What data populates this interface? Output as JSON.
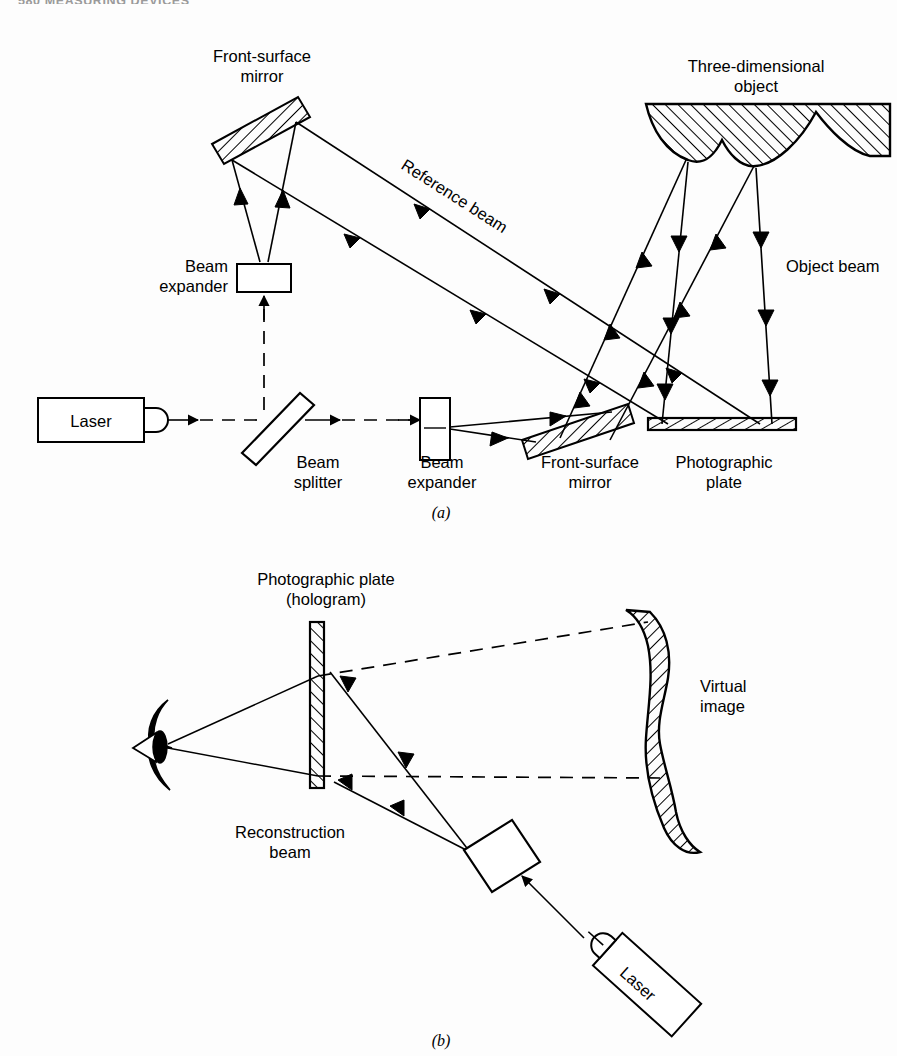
{
  "page": {
    "running_head": "580  MEASURING DEVICES",
    "width": 897,
    "height": 1056,
    "background": "#ffffff",
    "ink": "#000000"
  },
  "figure_a": {
    "caption": "(a)",
    "labels": {
      "front_surface_mirror_top_line1": "Front-surface",
      "front_surface_mirror_top_line2": "mirror",
      "beam_expander_left_line1": "Beam",
      "beam_expander_left_line2": "expander",
      "reference_beam": "Reference beam",
      "three_dimensional_object_line1": "Three-dimensional",
      "three_dimensional_object_line2": "object",
      "object_beam": "Object beam",
      "laser": "Laser",
      "beam_splitter_line1": "Beam",
      "beam_splitter_line2": "splitter",
      "beam_expander_bottom_line1": "Beam",
      "beam_expander_bottom_line2": "expander",
      "front_surface_mirror_bottom_line1": "Front-surface",
      "front_surface_mirror_bottom_line2": "mirror",
      "photographic_plate_line1": "Photographic",
      "photographic_plate_line2": "plate"
    },
    "components": [
      "laser-source",
      "beam-splitter",
      "beam-expander-vertical",
      "front-surface-mirror-upper",
      "beam-expander-horizontal",
      "front-surface-mirror-lower",
      "photographic-plate",
      "three-dimensional-object"
    ]
  },
  "figure_b": {
    "caption": "(b)",
    "labels": {
      "photographic_plate_line1": "Photographic plate",
      "photographic_plate_line2": "(hologram)",
      "virtual_image_line1": "Virtual",
      "virtual_image_line2": "image",
      "reconstruction_beam_line1": "Reconstruction",
      "reconstruction_beam_line2": "beam",
      "laser": "Laser"
    },
    "components": [
      "hologram-plate",
      "observer-eye",
      "virtual-image-object",
      "beam-expander-tilted",
      "laser-source-tilted"
    ]
  }
}
